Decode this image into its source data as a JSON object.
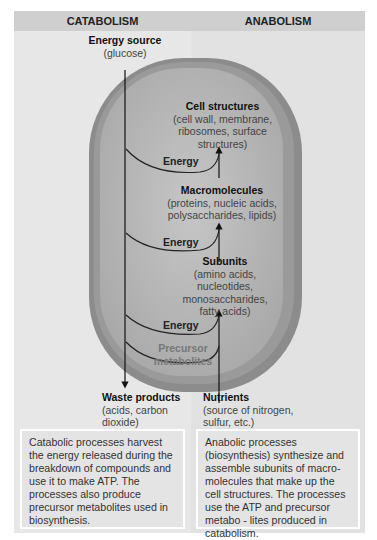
{
  "header": {
    "left_title": "CATABOLISM",
    "right_title": "ANABOLISM"
  },
  "top_input": {
    "title": "Energy source",
    "detail": "(glucose)"
  },
  "levels": [
    {
      "title": "Cell structures",
      "detail_lines": [
        "(cell wall, membrane,",
        "ribosomes, surface",
        "structures)"
      ]
    },
    {
      "title": "Macromolecules",
      "detail_lines": [
        "(proteins, nucleic acids,",
        "polysaccharides, lipids)"
      ]
    },
    {
      "title": "Subunits",
      "detail_lines": [
        "(amino acids,",
        "nucleotides,",
        "monosaccharides,",
        "fatty acids)"
      ]
    }
  ],
  "energy_labels": [
    "Energy",
    "Energy",
    "Energy"
  ],
  "precursor": {
    "line1": "Precursor",
    "line2": "metabolites"
  },
  "waste": {
    "title": "Waste products",
    "detail_lines": [
      "(acids, carbon",
      "dioxide)"
    ]
  },
  "nutrients": {
    "title": "Nutrients",
    "detail_lines": [
      "(source of nitrogen,",
      "sulfur, etc.)"
    ]
  },
  "descriptions": {
    "catabolism": "Catabolic processes harvest the energy released during the breakdown of compounds and use it to make ATP. The processes also produce precursor metabolites used in biosynthesis.",
    "anabolism": "Anabolic processes (biosynthesis) synthesize and assemble subunits of macro-molecules that make up the cell structures. The processes use the ATP and precursor metabo - lites produced in catabolism."
  },
  "colors": {
    "panel_bg": "#e7e7e7",
    "header_bg": "#cfcfcf",
    "cell_rim": "#8a8a8a",
    "cell_fill": "#b9b9b9",
    "precursor_text": "#777777"
  }
}
